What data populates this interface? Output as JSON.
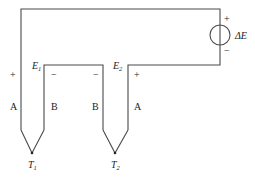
{
  "diagram": {
    "type": "thermocouple-circuit",
    "source": {
      "label": "ΔE",
      "plus": "+",
      "minus": "−"
    },
    "junctions": [
      {
        "id": "T1",
        "label": "T",
        "subscript": "1"
      },
      {
        "id": "T2",
        "label": "T",
        "subscript": "2"
      }
    ],
    "emfs": [
      {
        "id": "E1",
        "label": "E",
        "subscript": "1"
      },
      {
        "id": "E2",
        "label": "E",
        "subscript": "2"
      }
    ],
    "wires": [
      {
        "label": "A",
        "polarity": "+"
      },
      {
        "label": "B",
        "polarity": "−"
      },
      {
        "label": "B",
        "polarity": "−"
      },
      {
        "label": "A",
        "polarity": "+"
      }
    ]
  }
}
